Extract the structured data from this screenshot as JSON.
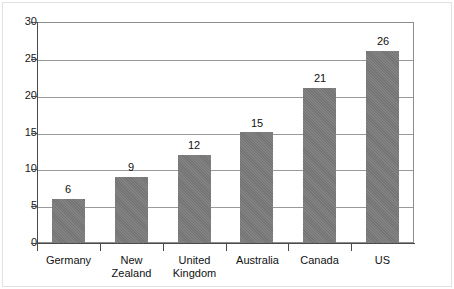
{
  "chart_data": {
    "type": "bar",
    "title": "",
    "xlabel": "",
    "ylabel": "",
    "categories": [
      "Germany",
      "New Zealand",
      "United\nKingdom",
      "Australia",
      "Canada",
      "US"
    ],
    "values": [
      6,
      9,
      12,
      15,
      21,
      26
    ],
    "value_labels": [
      "6",
      "9",
      "12",
      "15",
      "21",
      "26"
    ],
    "ylim": [
      0,
      30
    ],
    "ytick_values": [
      0,
      5,
      10,
      15,
      20,
      25,
      30
    ],
    "ytick_labels": [
      "0",
      "5",
      "10",
      "15",
      "20",
      "25",
      "30"
    ],
    "grid": true,
    "legend": "none",
    "series": [
      {
        "name": "",
        "values": [
          6,
          9,
          12,
          15,
          21,
          26
        ],
        "color": "#7a7a7a"
      }
    ],
    "colors": {
      "bar": "#7a7a7a",
      "gridline": "#9a9a9a",
      "axis": "#4a4a4a",
      "text": "#111111",
      "background": "#ffffff"
    }
  }
}
